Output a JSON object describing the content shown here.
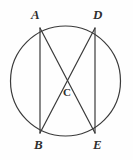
{
  "figure": {
    "kind": "circle-with-inscribed-chords",
    "background_color": "#fefefe",
    "stroke_color": "#3a3a3a",
    "label_color": "#2f2f2f",
    "circle": {
      "cx": 65.5,
      "cy": 81,
      "r": 55,
      "stroke_width": 1.2
    },
    "points": {
      "A": {
        "x": 40,
        "y": 28,
        "label": "A"
      },
      "D": {
        "x": 95,
        "y": 28,
        "label": "D"
      },
      "B": {
        "x": 40,
        "y": 133,
        "label": "B"
      },
      "E": {
        "x": 95,
        "y": 133,
        "label": "E"
      },
      "C": {
        "x": 67,
        "y": 80,
        "label": "C"
      }
    },
    "chords": [
      {
        "name": "chord-AB",
        "from": "A",
        "to": "B",
        "x1": 40,
        "y1": 28,
        "x2": 40,
        "y2": 133
      },
      {
        "name": "chord-DE",
        "from": "D",
        "to": "E",
        "x1": 95,
        "y1": 28,
        "x2": 95,
        "y2": 133
      },
      {
        "name": "chord-AE",
        "from": "A",
        "to": "E",
        "x1": 40,
        "y1": 28,
        "x2": 95,
        "y2": 133
      },
      {
        "name": "chord-DB",
        "from": "D",
        "to": "B",
        "x1": 95,
        "y1": 28,
        "x2": 40,
        "y2": 133
      }
    ]
  }
}
